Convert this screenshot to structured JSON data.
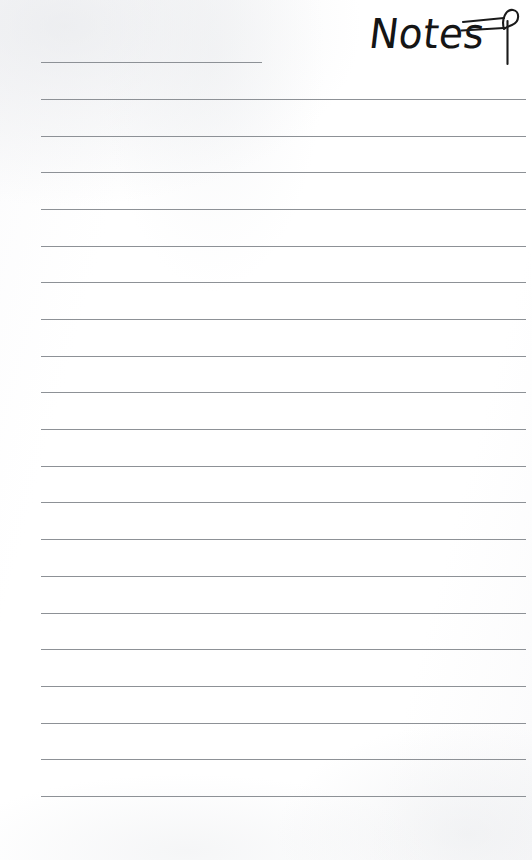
{
  "page": {
    "name": "lined-notes-page",
    "background_color": "#ffffff",
    "width": 532,
    "height": 860
  },
  "header": {
    "title": "Notes",
    "title_color": "#151515",
    "decoration_icon": "quill-pen-flourish-icon"
  },
  "ruled_lines": {
    "color": "#8d9196",
    "thickness_px": 1,
    "left_margin_px": 41,
    "spacing_px": 36.7,
    "count": 21,
    "full_line_width_px": 485,
    "short_line_width_px": 221,
    "lines": [
      {
        "index": 1,
        "y": 62,
        "style": "short",
        "text": ""
      },
      {
        "index": 2,
        "y": 99,
        "style": "full",
        "text": ""
      },
      {
        "index": 3,
        "y": 136,
        "style": "full",
        "text": ""
      },
      {
        "index": 4,
        "y": 172,
        "style": "full",
        "text": ""
      },
      {
        "index": 5,
        "y": 209,
        "style": "full",
        "text": ""
      },
      {
        "index": 6,
        "y": 246,
        "style": "full",
        "text": ""
      },
      {
        "index": 7,
        "y": 282,
        "style": "full",
        "text": ""
      },
      {
        "index": 8,
        "y": 319,
        "style": "full",
        "text": ""
      },
      {
        "index": 9,
        "y": 356,
        "style": "full",
        "text": ""
      },
      {
        "index": 10,
        "y": 392,
        "style": "full",
        "text": ""
      },
      {
        "index": 11,
        "y": 429,
        "style": "full",
        "text": ""
      },
      {
        "index": 12,
        "y": 466,
        "style": "full",
        "text": ""
      },
      {
        "index": 13,
        "y": 502,
        "style": "full",
        "text": ""
      },
      {
        "index": 14,
        "y": 539,
        "style": "full",
        "text": ""
      },
      {
        "index": 15,
        "y": 576,
        "style": "full",
        "text": ""
      },
      {
        "index": 16,
        "y": 613,
        "style": "full",
        "text": ""
      },
      {
        "index": 17,
        "y": 649,
        "style": "full",
        "text": ""
      },
      {
        "index": 18,
        "y": 686,
        "style": "full",
        "text": ""
      },
      {
        "index": 19,
        "y": 723,
        "style": "full",
        "text": ""
      },
      {
        "index": 20,
        "y": 759,
        "style": "full",
        "text": ""
      },
      {
        "index": 21,
        "y": 796,
        "style": "full",
        "text": ""
      }
    ]
  }
}
